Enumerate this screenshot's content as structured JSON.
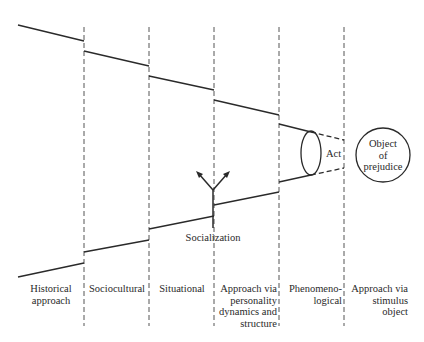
{
  "diagram": {
    "columns": [
      {
        "id": "historical",
        "label_lines": [
          "Historical",
          "approach"
        ]
      },
      {
        "id": "sociocultural",
        "label_lines": [
          "Sociocultural"
        ]
      },
      {
        "id": "situational",
        "label_lines": [
          "Situational"
        ]
      },
      {
        "id": "personality",
        "label_lines": [
          "Approach via",
          "personality",
          "dynamics and",
          "structure"
        ]
      },
      {
        "id": "phenomenological",
        "label_lines": [
          "Phenomeno-",
          "logical"
        ]
      },
      {
        "id": "stimulus",
        "label_lines": [
          "Approach via",
          "stimulus",
          "object"
        ]
      }
    ],
    "socialization_label": "Socialization",
    "act_label": "Act",
    "object_label_lines": [
      "Object",
      "of",
      "prejudice"
    ],
    "colors": {
      "line": "#2a2a2a",
      "dash": "#555555",
      "background": "#ffffff"
    }
  }
}
